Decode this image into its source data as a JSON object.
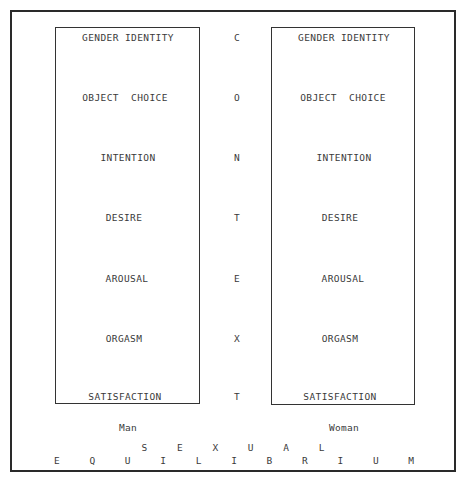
{
  "title": {
    "line1": "S E X U A L",
    "line2": "E Q U I L I B R I U M"
  },
  "man": {
    "label": "Man",
    "items": [
      "GENDER IDENTITY",
      "OBJECT  CHOICE",
      "INTENTION",
      "DESIRE",
      "AROUSAL",
      "ORGASM",
      "SATISFACTION"
    ]
  },
  "woman": {
    "label": "Woman",
    "items": [
      "GENDER IDENTITY",
      "OBJECT  CHOICE",
      "INTENTION",
      "DESIRE",
      "AROUSAL",
      "ORGASM",
      "SATISFACTION"
    ]
  },
  "context": {
    "letters": [
      "C",
      "O",
      "N",
      "T",
      "E",
      "X",
      "T"
    ]
  }
}
